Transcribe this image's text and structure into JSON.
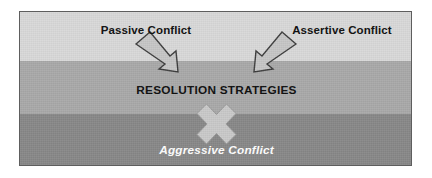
{
  "figure": {
    "background_color": "#ffffff",
    "frame": {
      "border_color": "#5e5e5e",
      "x": 19,
      "y": 11,
      "width": 393,
      "height": 155
    },
    "bands": [
      {
        "name": "passive-band",
        "color": "#d9d9d9",
        "top": 0,
        "height": 49
      },
      {
        "name": "assertive-band",
        "color": "#a9a9a9",
        "top": 49,
        "height": 53
      },
      {
        "name": "aggressive-band",
        "color": "#888888",
        "top": 102,
        "height": 53
      }
    ],
    "labels": {
      "passive": "Passive Conflict",
      "assertive": "Assertive Conflict",
      "resolution": "RESOLUTION STRATEGIES",
      "aggressive": "Aggressive Conflict"
    },
    "label_colors": {
      "dark_text": "#0d0d0d",
      "white_text": "#ffffff"
    },
    "shapes": {
      "arrow_fill": "#c6c6c6",
      "arrow_stroke": "#3d3d3d",
      "cross_fill": "#c9c9c9",
      "cross_stroke": "#9a9a9a",
      "left_arrow_direction": "down-right",
      "right_arrow_direction": "down-left",
      "cross_glyph": "x-cross"
    }
  }
}
